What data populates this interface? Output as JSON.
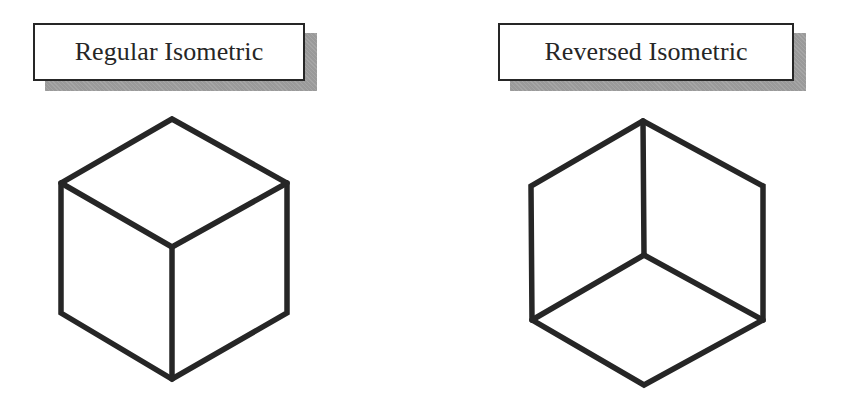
{
  "colors": {
    "background": "#ffffff",
    "stroke": "#262626",
    "label_border": "#262626",
    "label_text": "#262626",
    "label_shadow": "#9a9a9a"
  },
  "panels": [
    {
      "id": "regular",
      "label": "Regular Isometric",
      "label_box": {
        "x": 33,
        "y": 23,
        "w": 272,
        "h": 58
      },
      "cube": {
        "description": "Cube viewed from above: top face visible, vertical front edge from center down",
        "vertices": {
          "top": [
            172,
            119
          ],
          "upper_left": [
            61,
            183
          ],
          "upper_right": [
            287,
            183
          ],
          "center": [
            172,
            247
          ],
          "lower_left": [
            61,
            313
          ],
          "lower_right": [
            287,
            313
          ],
          "bottom": [
            172,
            379
          ]
        }
      }
    },
    {
      "id": "reversed",
      "label": "Reversed Isometric",
      "label_box": {
        "x": 498,
        "y": 23,
        "w": 296,
        "h": 58
      },
      "cube": {
        "description": "Cube viewed from below: bottom face visible, vertical edge from top down to center",
        "vertices": {
          "top": [
            643,
            121
          ],
          "upper_left": [
            531,
            186
          ],
          "upper_right": [
            763,
            186
          ],
          "center": [
            644,
            255
          ],
          "lower_left": [
            532,
            320
          ],
          "lower_right": [
            763,
            320
          ],
          "bottom": [
            644,
            385
          ]
        }
      }
    }
  ]
}
